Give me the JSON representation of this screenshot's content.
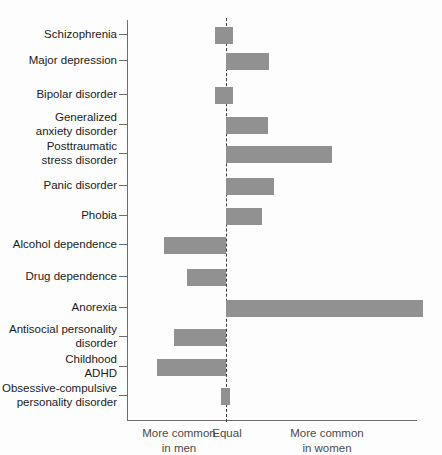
{
  "chart_data": {
    "type": "bar",
    "orientation": "horizontal",
    "title": "",
    "subtitle": "",
    "xlabel": "",
    "ylabel": "",
    "grid": false,
    "legend_position": "none",
    "zero_reference": "Equal",
    "xlim": [
      -1.0,
      2.0
    ],
    "categories": [
      "Schizophrenia",
      "Major depression",
      "Bipolar disorder",
      "Generalized\nanxiety disorder",
      "Posttraumatic\nstress disorder",
      "Panic disorder",
      "Phobia",
      "Alcohol dependence",
      "Drug dependence",
      "Anorexia",
      "Antisocial personality\ndisorder",
      "Childhood\nADHD",
      "Obsessive-compulsive\npersonality disorder"
    ],
    "values": [
      -0.11,
      0.44,
      -0.11,
      0.43,
      1.08,
      0.49,
      0.37,
      -0.63,
      -0.4,
      2.01,
      -0.53,
      -0.7,
      0.04
    ],
    "bars": [
      {
        "label": "Schizophrenia",
        "label_lines": [
          "Schizophrenia"
        ],
        "value": -0.11,
        "start_px": 215,
        "end_px": 233,
        "center_y": 35
      },
      {
        "label": "Major depression",
        "label_lines": [
          "Major depression"
        ],
        "value": 0.44,
        "start_px": 226,
        "end_px": 269,
        "center_y": 61
      },
      {
        "label": "Bipolar disorder",
        "label_lines": [
          "Bipolar disorder"
        ],
        "value": -0.11,
        "start_px": 215,
        "end_px": 233,
        "center_y": 95
      },
      {
        "label": "Generalized anxiety disorder",
        "label_lines": [
          "Generalized",
          "anxiety disorder"
        ],
        "value": 0.43,
        "start_px": 226,
        "end_px": 268,
        "center_y": 125
      },
      {
        "label": "Posttraumatic stress disorder",
        "label_lines": [
          "Posttraumatic",
          "stress disorder"
        ],
        "value": 1.08,
        "start_px": 226,
        "end_px": 332,
        "center_y": 154
      },
      {
        "label": "Panic disorder",
        "label_lines": [
          "Panic disorder"
        ],
        "value": 0.49,
        "start_px": 226,
        "end_px": 274,
        "center_y": 186
      },
      {
        "label": "Phobia",
        "label_lines": [
          "Phobia"
        ],
        "value": 0.37,
        "start_px": 226,
        "end_px": 262,
        "center_y": 216
      },
      {
        "label": "Alcohol dependence",
        "label_lines": [
          "Alcohol dependence"
        ],
        "value": -0.63,
        "start_px": 164,
        "end_px": 226,
        "center_y": 245
      },
      {
        "label": "Drug dependence",
        "label_lines": [
          "Drug dependence"
        ],
        "value": -0.4,
        "start_px": 187,
        "end_px": 226,
        "center_y": 277
      },
      {
        "label": "Anorexia",
        "label_lines": [
          "Anorexia"
        ],
        "value": 2.01,
        "start_px": 226,
        "end_px": 423,
        "center_y": 308
      },
      {
        "label": "Antisocial personality disorder",
        "label_lines": [
          "Antisocial personality",
          "disorder"
        ],
        "value": -0.53,
        "start_px": 174,
        "end_px": 226,
        "center_y": 337
      },
      {
        "label": "Childhood ADHD",
        "label_lines": [
          "Childhood",
          "ADHD"
        ],
        "value": -0.7,
        "start_px": 157,
        "end_px": 226,
        "center_y": 367
      },
      {
        "label": "Obsessive-compulsive personality disorder",
        "label_lines": [
          "Obsessive-compulsive",
          "personality disorder"
        ],
        "value": 0.04,
        "start_px": 221,
        "end_px": 230,
        "center_y": 396
      }
    ],
    "axis_notes": {
      "left": "More common\nin men",
      "center": "Equal",
      "right": "More common\nin women"
    },
    "colors": {
      "bar": "#919191",
      "axis": "#6d6d6d",
      "zero_line": "#3a3a3a",
      "label_text": "#1b1b1b",
      "note_text": "#4a4a4a",
      "background": "#fdfdfd"
    }
  }
}
